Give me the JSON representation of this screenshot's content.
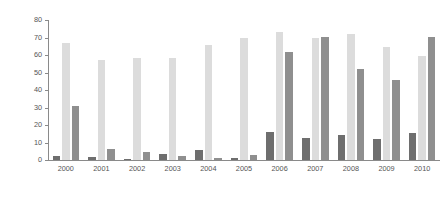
{
  "chart_data": {
    "type": "bar",
    "title": "",
    "xlabel": "",
    "ylabel": "% energy/total imports from region",
    "ylim": [
      0,
      80
    ],
    "yticks": [
      0,
      10,
      20,
      30,
      40,
      50,
      60,
      70,
      80
    ],
    "grid": false,
    "legend": "none",
    "categories": [
      "2000",
      "2001",
      "2002",
      "2003",
      "2004",
      "2005",
      "2006",
      "2007",
      "2008",
      "2009",
      "2010"
    ],
    "series": [
      {
        "name": "series-1",
        "color": "#6e6e6e",
        "values": [
          2.5,
          2.0,
          0.8,
          3.5,
          5.8,
          1.2,
          16.0,
          12.5,
          14.5,
          12.0,
          15.5
        ]
      },
      {
        "name": "series-2",
        "color": "#dcdcdc",
        "values": [
          67.0,
          57.0,
          58.5,
          58.5,
          65.5,
          69.5,
          73.0,
          70.0,
          72.0,
          64.5,
          59.5
        ]
      },
      {
        "name": "series-3",
        "color": "#8f8f8f",
        "values": [
          31.0,
          6.5,
          4.8,
          2.5,
          1.0,
          3.0,
          61.5,
          70.5,
          52.0,
          45.5,
          70.5
        ]
      }
    ]
  }
}
